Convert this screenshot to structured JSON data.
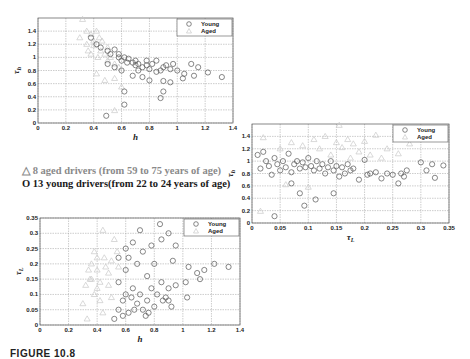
{
  "legend_text": {
    "aged": {
      "symbol": "△",
      "label": "8 aged drivers (from 59  to 75 years of age)"
    },
    "young": {
      "symbol": "O",
      "label": "13 young drivers(from 22 to 24 years of age)"
    }
  },
  "caption": "FIGURE 10.8",
  "colors": {
    "young": "#555555",
    "aged": "#c8c8c8"
  },
  "chart_data": [
    {
      "id": "top-left",
      "type": "scatter",
      "title": "",
      "xlabel": "h",
      "ylabel": "τh",
      "xlim": [
        0,
        1.4
      ],
      "ylim": [
        0,
        1.6
      ],
      "xticks": [
        "0",
        "0.2",
        "0.4",
        "0.6",
        "0.8",
        "1",
        "1.2",
        "1.4"
      ],
      "yticks": [
        "0",
        "0.2",
        "0.4",
        "0.6",
        "0.8",
        "1",
        "1.2",
        "1.4"
      ],
      "grid": true,
      "legend": {
        "position": "top-right",
        "entries": [
          "Young",
          "Aged"
        ]
      },
      "series": [
        {
          "name": "Young",
          "marker": "circle",
          "points": [
            [
              0.38,
              1.3
            ],
            [
              0.42,
              1.2
            ],
            [
              0.45,
              1.15
            ],
            [
              0.5,
              1.1
            ],
            [
              0.52,
              1.05
            ],
            [
              0.55,
              1.12
            ],
            [
              0.58,
              1.0
            ],
            [
              0.6,
              0.95
            ],
            [
              0.62,
              1.0
            ],
            [
              0.65,
              0.98
            ],
            [
              0.68,
              0.92
            ],
            [
              0.7,
              0.95
            ],
            [
              0.72,
              0.9
            ],
            [
              0.75,
              0.85
            ],
            [
              0.78,
              0.88
            ],
            [
              0.8,
              0.82
            ],
            [
              0.82,
              0.9
            ],
            [
              0.85,
              0.95
            ],
            [
              0.88,
              0.8
            ],
            [
              0.9,
              0.85
            ],
            [
              0.95,
              0.82
            ],
            [
              1.0,
              0.8
            ],
            [
              1.05,
              0.75
            ],
            [
              1.1,
              0.9
            ],
            [
              1.12,
              0.72
            ],
            [
              1.15,
              0.85
            ],
            [
              1.22,
              0.77
            ],
            [
              1.32,
              0.7
            ],
            [
              0.55,
              0.85
            ],
            [
              0.62,
              0.48
            ],
            [
              0.62,
              0.28
            ],
            [
              0.49,
              0.11
            ],
            [
              0.88,
              0.38
            ],
            [
              0.9,
              0.48
            ],
            [
              0.9,
              0.64
            ],
            [
              0.95,
              0.62
            ],
            [
              1.04,
              0.68
            ],
            [
              0.68,
              0.72
            ],
            [
              0.75,
              0.7
            ],
            [
              0.8,
              0.65
            ],
            [
              0.5,
              0.9
            ],
            [
              0.6,
              0.8
            ],
            [
              0.7,
              0.88
            ],
            [
              0.78,
              0.95
            ],
            [
              0.85,
              0.78
            ],
            [
              0.92,
              0.88
            ],
            [
              0.97,
              0.9
            ],
            [
              0.58,
              1.05
            ],
            [
              0.64,
              0.92
            ],
            [
              0.72,
              0.8
            ]
          ]
        },
        {
          "name": "Aged",
          "marker": "triangle",
          "points": [
            [
              0.32,
              1.58
            ],
            [
              0.35,
              1.4
            ],
            [
              0.38,
              1.35
            ],
            [
              0.4,
              1.25
            ],
            [
              0.42,
              1.4
            ],
            [
              0.44,
              1.3
            ],
            [
              0.36,
              1.1
            ],
            [
              0.38,
              1.05
            ],
            [
              0.4,
              1.18
            ],
            [
              0.43,
              1.0
            ],
            [
              0.45,
              1.1
            ],
            [
              0.48,
              1.05
            ],
            [
              0.5,
              0.95
            ],
            [
              0.52,
              1.0
            ],
            [
              0.55,
              0.9
            ],
            [
              0.58,
              0.85
            ],
            [
              0.42,
              0.75
            ],
            [
              0.48,
              0.65
            ],
            [
              0.55,
              0.68
            ],
            [
              0.6,
              0.55
            ],
            [
              0.55,
              0.19
            ],
            [
              0.46,
              1.25
            ],
            [
              0.5,
              1.15
            ],
            [
              0.35,
              1.2
            ],
            [
              0.3,
              1.3
            ]
          ]
        }
      ]
    },
    {
      "id": "right",
      "type": "scatter",
      "title": "",
      "xlabel": "τL",
      "ylabel": "τh",
      "xlim": [
        0,
        0.35
      ],
      "ylim": [
        0,
        1.6
      ],
      "xticks": [
        "0",
        "0.05",
        "0.1",
        "0.15",
        "0.2",
        "0.25",
        "0.3",
        "0.35"
      ],
      "yticks": [
        "0",
        "0.2",
        "0.4",
        "0.6",
        "0.8",
        "1",
        "1.2",
        "1.4"
      ],
      "grid": true,
      "legend": {
        "position": "top-right",
        "entries": [
          "Young",
          "Aged"
        ]
      },
      "series": [
        {
          "name": "Young",
          "marker": "circle",
          "points": [
            [
              0.01,
              1.1
            ],
            [
              0.015,
              0.88
            ],
            [
              0.02,
              1.15
            ],
            [
              0.025,
              1.0
            ],
            [
              0.03,
              0.92
            ],
            [
              0.035,
              0.78
            ],
            [
              0.04,
              1.05
            ],
            [
              0.045,
              0.95
            ],
            [
              0.05,
              0.85
            ],
            [
              0.055,
              1.0
            ],
            [
              0.06,
              0.9
            ],
            [
              0.065,
              1.12
            ],
            [
              0.07,
              0.82
            ],
            [
              0.075,
              0.95
            ],
            [
              0.08,
              1.0
            ],
            [
              0.085,
              0.88
            ],
            [
              0.09,
              0.98
            ],
            [
              0.095,
              0.9
            ],
            [
              0.1,
              1.05
            ],
            [
              0.105,
              0.92
            ],
            [
              0.11,
              0.85
            ],
            [
              0.115,
              1.0
            ],
            [
              0.12,
              0.88
            ],
            [
              0.125,
              0.95
            ],
            [
              0.13,
              0.8
            ],
            [
              0.135,
              0.9
            ],
            [
              0.14,
              1.0
            ],
            [
              0.145,
              0.85
            ],
            [
              0.15,
              0.92
            ],
            [
              0.155,
              0.75
            ],
            [
              0.16,
              0.9
            ],
            [
              0.165,
              0.8
            ],
            [
              0.17,
              0.95
            ],
            [
              0.175,
              0.85
            ],
            [
              0.18,
              0.88
            ],
            [
              0.19,
              0.7
            ],
            [
              0.2,
              1.02
            ],
            [
              0.205,
              0.78
            ],
            [
              0.21,
              0.8
            ],
            [
              0.22,
              0.82
            ],
            [
              0.23,
              0.72
            ],
            [
              0.24,
              0.8
            ],
            [
              0.25,
              0.78
            ],
            [
              0.26,
              0.64
            ],
            [
              0.265,
              0.8
            ],
            [
              0.27,
              0.75
            ],
            [
              0.275,
              0.85
            ],
            [
              0.3,
              0.98
            ],
            [
              0.31,
              0.85
            ],
            [
              0.32,
              0.95
            ],
            [
              0.325,
              0.73
            ],
            [
              0.34,
              0.93
            ],
            [
              0.04,
              0.11
            ],
            [
              0.07,
              0.64
            ],
            [
              0.085,
              0.48
            ],
            [
              0.093,
              0.28
            ],
            [
              0.113,
              0.38
            ],
            [
              0.145,
              0.48
            ]
          ]
        },
        {
          "name": "Aged",
          "marker": "triangle",
          "points": [
            [
              0.02,
              1.38
            ],
            [
              0.015,
              0.19
            ],
            [
              0.05,
              1.2
            ],
            [
              0.07,
              1.3
            ],
            [
              0.09,
              1.25
            ],
            [
              0.11,
              1.35
            ],
            [
              0.13,
              1.4
            ],
            [
              0.15,
              1.3
            ],
            [
              0.155,
              1.58
            ],
            [
              0.16,
              1.22
            ],
            [
              0.17,
              1.35
            ],
            [
              0.18,
              1.28
            ],
            [
              0.19,
              1.15
            ],
            [
              0.2,
              1.32
            ],
            [
              0.21,
              1.1
            ],
            [
              0.22,
              1.42
            ],
            [
              0.23,
              1.05
            ],
            [
              0.24,
              1.2
            ],
            [
              0.26,
              1.12
            ],
            [
              0.28,
              1.28
            ],
            [
              0.12,
              1.2
            ],
            [
              0.14,
              1.1
            ],
            [
              0.06,
              0.62
            ],
            [
              0.1,
              0.58
            ],
            [
              0.175,
              1.05
            ]
          ]
        }
      ]
    },
    {
      "id": "bottom-left",
      "type": "scatter",
      "title": "",
      "xlabel": "h",
      "ylabel": "τL",
      "xlim": [
        0,
        1.4
      ],
      "ylim": [
        0,
        0.35
      ],
      "xticks": [
        "0",
        "0.2",
        "0.4",
        "0.6",
        "0.8",
        "1",
        "1.2",
        "1.4"
      ],
      "yticks": [
        "0",
        "0.05",
        "0.1",
        "0.15",
        "0.2",
        "0.25",
        "0.3",
        "0.35"
      ],
      "grid": true,
      "legend": {
        "position": "top-right",
        "entries": [
          "Young",
          "Aged"
        ]
      },
      "series": [
        {
          "name": "Young",
          "marker": "circle",
          "points": [
            [
              0.52,
              0.02
            ],
            [
              0.55,
              0.05
            ],
            [
              0.58,
              0.08
            ],
            [
              0.6,
              0.1
            ],
            [
              0.62,
              0.04
            ],
            [
              0.65,
              0.12
            ],
            [
              0.68,
              0.07
            ],
            [
              0.7,
              0.1
            ],
            [
              0.72,
              0.05
            ],
            [
              0.75,
              0.08
            ],
            [
              0.78,
              0.12
            ],
            [
              0.8,
              0.06
            ],
            [
              0.82,
              0.1
            ],
            [
              0.85,
              0.14
            ],
            [
              0.88,
              0.09
            ],
            [
              0.9,
              0.12
            ],
            [
              0.55,
              0.14
            ],
            [
              0.6,
              0.18
            ],
            [
              0.62,
              0.22
            ],
            [
              0.65,
              0.27
            ],
            [
              0.68,
              0.2
            ],
            [
              0.7,
              0.31
            ],
            [
              0.72,
              0.24
            ],
            [
              0.75,
              0.16
            ],
            [
              0.78,
              0.26
            ],
            [
              0.8,
              0.2
            ],
            [
              0.84,
              0.33
            ],
            [
              0.85,
              0.28
            ],
            [
              0.9,
              0.3
            ],
            [
              0.93,
              0.21
            ],
            [
              0.95,
              0.26
            ],
            [
              0.95,
              0.13
            ],
            [
              1.02,
              0.14
            ],
            [
              1.03,
              0.09
            ],
            [
              1.04,
              0.19
            ],
            [
              1.1,
              0.17
            ],
            [
              1.12,
              0.15
            ],
            [
              1.15,
              0.18
            ],
            [
              1.22,
              0.2
            ],
            [
              1.32,
              0.19
            ],
            [
              0.58,
              0.03
            ],
            [
              0.66,
              0.05
            ],
            [
              0.74,
              0.03
            ],
            [
              0.76,
              0.04
            ],
            [
              0.64,
              0.09
            ],
            [
              0.86,
              0.08
            ],
            [
              0.9,
              0.08
            ],
            [
              0.92,
              0.06
            ],
            [
              0.55,
              0.22
            ],
            [
              0.6,
              0.25
            ]
          ]
        },
        {
          "name": "Aged",
          "marker": "triangle",
          "points": [
            [
              0.33,
              0.02
            ],
            [
              0.3,
              0.07
            ],
            [
              0.32,
              0.13
            ],
            [
              0.35,
              0.15
            ],
            [
              0.36,
              0.2
            ],
            [
              0.38,
              0.24
            ],
            [
              0.4,
              0.18
            ],
            [
              0.42,
              0.14
            ],
            [
              0.44,
              0.31
            ],
            [
              0.45,
              0.22
            ],
            [
              0.46,
              0.19
            ],
            [
              0.48,
              0.17
            ],
            [
              0.5,
              0.21
            ],
            [
              0.52,
              0.28
            ],
            [
              0.54,
              0.24
            ],
            [
              0.55,
              0.19
            ],
            [
              0.4,
              0.12
            ],
            [
              0.42,
              0.08
            ],
            [
              0.38,
              0.1
            ],
            [
              0.44,
              0.04
            ],
            [
              0.36,
              0.15
            ],
            [
              0.48,
              0.13
            ],
            [
              0.5,
              0.09
            ],
            [
              0.34,
              0.18
            ],
            [
              0.4,
              0.22
            ]
          ]
        }
      ]
    }
  ]
}
